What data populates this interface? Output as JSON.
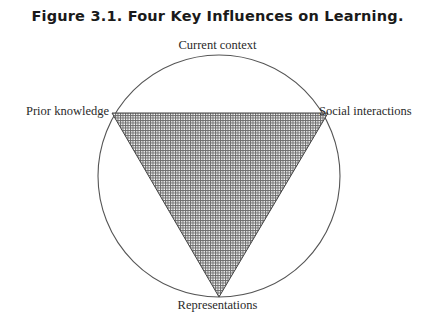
{
  "figure": {
    "title": "Figure 3.1.  Four Key Influences on Learning.",
    "labels": {
      "top": "Current context",
      "left": "Prior knowledge",
      "right": "Social interactions",
      "bottom": "Representations"
    },
    "shapes": {
      "circle": {
        "cx": 219,
        "cy": 176,
        "r": 121,
        "stroke": "#555555"
      },
      "triangle": {
        "points": "112,113 328,113 219,297",
        "fill_pattern": "dotted-grid",
        "stroke": "#444444"
      }
    }
  }
}
